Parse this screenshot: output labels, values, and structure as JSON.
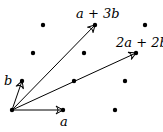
{
  "diagram": {
    "title": "",
    "basis": {
      "a": [
        51,
        0
      ],
      "b": [
        10,
        -29
      ]
    },
    "origin": [
      12,
      110
    ],
    "lattice_points": [
      [
        43,
        25
      ],
      [
        95,
        25
      ],
      [
        145,
        25
      ],
      [
        33,
        53
      ],
      [
        84,
        53
      ],
      [
        136,
        53
      ],
      [
        22,
        81
      ],
      [
        74,
        81
      ],
      [
        125,
        81
      ],
      [
        12,
        110
      ],
      [
        63,
        110
      ],
      [
        115,
        110
      ]
    ],
    "vectors": [
      {
        "name": "a",
        "to": [
          63,
          110
        ],
        "label": "a",
        "label_pos": [
          60,
          126
        ]
      },
      {
        "name": "b",
        "to": [
          22,
          81
        ],
        "label": "b",
        "label_pos": [
          4,
          85
        ]
      },
      {
        "name": "a+3b",
        "to": [
          95,
          25
        ],
        "label": "a + 3b",
        "label_pos": [
          76,
          18
        ]
      },
      {
        "name": "2a+2b",
        "to": [
          136,
          53
        ],
        "label": "2a + 2b",
        "label_pos": [
          116,
          47
        ]
      }
    ],
    "color": "#000000"
  }
}
